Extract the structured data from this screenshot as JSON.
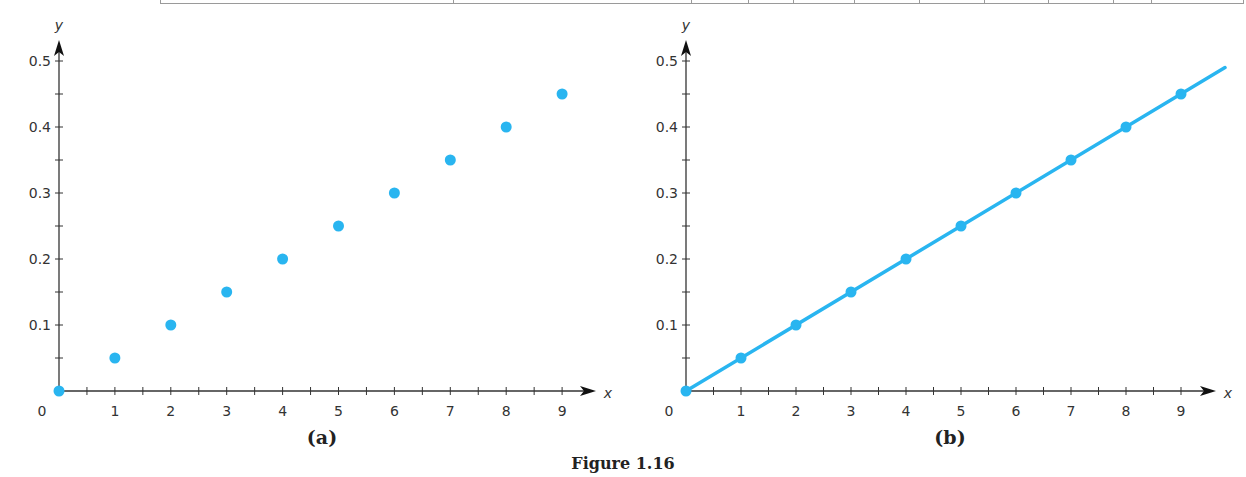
{
  "figure": {
    "caption": "Figure 1.16",
    "panels": [
      {
        "id": "a",
        "label": "(a)",
        "style": "points"
      },
      {
        "id": "b",
        "label": "(b)",
        "style": "points-with-line"
      }
    ]
  },
  "axes": {
    "x_label": "x",
    "y_label": "y",
    "origin_label": "0",
    "x_ticks": [
      "1",
      "2",
      "3",
      "4",
      "5",
      "6",
      "7",
      "8",
      "9"
    ],
    "y_ticks": [
      "0.1",
      "0.2",
      "0.3",
      "0.4",
      "0.5"
    ]
  },
  "colors": {
    "point": "#29B5F0",
    "line": "#29B5F0",
    "axis": "#333333"
  },
  "chart_data": [
    {
      "type": "scatter",
      "title": "(a)",
      "xlabel": "x",
      "ylabel": "y",
      "x": [
        0,
        1,
        2,
        3,
        4,
        5,
        6,
        7,
        8,
        9
      ],
      "y": [
        0,
        0.05,
        0.1,
        0.15,
        0.2,
        0.25,
        0.3,
        0.35,
        0.4,
        0.45
      ],
      "xlim": [
        0,
        9.5
      ],
      "ylim": [
        0,
        0.5
      ],
      "x_ticks": [
        1,
        2,
        3,
        4,
        5,
        6,
        7,
        8,
        9
      ],
      "y_ticks": [
        0.1,
        0.2,
        0.3,
        0.4,
        0.5
      ],
      "minor_ticks": "every 0.5 on x, every 0.05 on y",
      "grid": false,
      "legend": null
    },
    {
      "type": "line",
      "title": "(b)",
      "xlabel": "x",
      "ylabel": "y",
      "x": [
        0,
        1,
        2,
        3,
        4,
        5,
        6,
        7,
        8,
        9
      ],
      "y": [
        0,
        0.05,
        0.1,
        0.15,
        0.2,
        0.25,
        0.3,
        0.35,
        0.4,
        0.45
      ],
      "line_extends_to": {
        "x": 9.8,
        "y": 0.49
      },
      "markers": true,
      "xlim": [
        0,
        9.5
      ],
      "ylim": [
        0,
        0.5
      ],
      "x_ticks": [
        1,
        2,
        3,
        4,
        5,
        6,
        7,
        8,
        9
      ],
      "y_ticks": [
        0.1,
        0.2,
        0.3,
        0.4,
        0.5
      ],
      "grid": false,
      "legend": null
    }
  ]
}
